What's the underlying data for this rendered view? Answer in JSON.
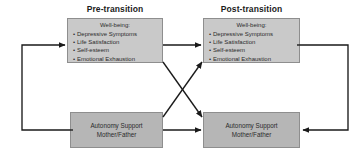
{
  "diagram": {
    "headers": {
      "pre": "Pre-transition",
      "post": "Post-transition"
    },
    "wellbeing": {
      "title": "Well-being:",
      "items": [
        "Depressive Symptoms",
        "Life Satisfaction",
        "Self-esteem",
        "Emotional Exhaustion"
      ]
    },
    "autonomy": {
      "line1": "Autonomy Support",
      "line2": "Mother/Father"
    },
    "colors": {
      "wellbeing_fill": "#c9c9c9",
      "autonomy_fill": "#b6b6b6",
      "box_border": "#8e8e8e",
      "arrow": "#1a1a1a",
      "text": "#2b2b2b",
      "header_text": "#1c1c1c",
      "background": "#ffffff"
    },
    "edges": [
      {
        "name": "wellbeing-pre-to-wellbeing-post",
        "from": "box-wb-pre",
        "to": "box-wb-post",
        "style": "straight-horizontal"
      },
      {
        "name": "autonomy-pre-to-autonomy-post",
        "from": "box-as-pre",
        "to": "box-as-post",
        "style": "straight-horizontal"
      },
      {
        "name": "wellbeing-pre-to-autonomy-post",
        "from": "box-wb-pre",
        "to": "box-as-post",
        "style": "diagonal-down"
      },
      {
        "name": "autonomy-pre-to-wellbeing-post",
        "from": "box-as-pre",
        "to": "box-wb-post",
        "style": "diagonal-up"
      },
      {
        "name": "autonomy-pre-to-wellbeing-pre-loop",
        "from": "box-as-pre",
        "to": "box-wb-pre",
        "style": "left-bracket"
      },
      {
        "name": "wellbeing-post-to-autonomy-post-loop",
        "from": "box-wb-post",
        "to": "box-as-post",
        "style": "right-bracket"
      }
    ]
  }
}
